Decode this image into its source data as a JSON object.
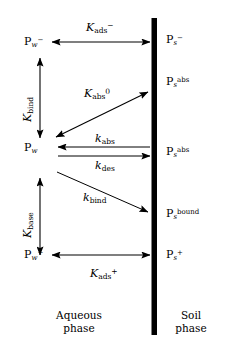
{
  "figure": {
    "soil_bar_color": "#000000",
    "background_color": "#ffffff",
    "stroke_color": "#000000"
  },
  "species": {
    "aqueous_anion": {
      "base": "P",
      "sub": "w",
      "sup": "−",
      "text": "P"
    },
    "aqueous_neutral": {
      "base": "P",
      "sub": "w",
      "sup": "",
      "text": "P"
    },
    "aqueous_cation": {
      "base": "P",
      "sub": "w",
      "sup": "+",
      "text": "P"
    },
    "soil_anion": {
      "base": "P",
      "sub": "s",
      "sup": "−",
      "text": "P"
    },
    "soil_abs_upper": {
      "base": "P",
      "sub": "s",
      "sup": "abs",
      "text": "P"
    },
    "soil_abs_lower": {
      "base": "P",
      "sub": "s",
      "sup": "abs",
      "text": "P"
    },
    "soil_bound": {
      "base": "P",
      "sub": "s",
      "sup": "bound",
      "text": "P"
    },
    "soil_cation": {
      "base": "P",
      "sub": "s",
      "sup": "+",
      "text": "P"
    }
  },
  "constants": {
    "k_ads_minus": {
      "base": "K",
      "sub": "ads",
      "sup": "−"
    },
    "k_abs_zero": {
      "base": "K",
      "sub": "abs",
      "sup": "0"
    },
    "k_abs": {
      "base": "k",
      "sub": "abs",
      "sup": ""
    },
    "k_des": {
      "base": "k",
      "sub": "des",
      "sup": ""
    },
    "k_bind": {
      "base": "k",
      "sub": "bind",
      "sup": ""
    },
    "k_ads_plus": {
      "base": "K",
      "sub": "ads",
      "sup": "+"
    },
    "K_bind": {
      "base": "K",
      "sub": "bind",
      "sup": ""
    },
    "K_base": {
      "base": "K",
      "sub": "base",
      "sup": ""
    }
  },
  "phases": {
    "aqueous_line1": "Aqueous",
    "aqueous_line2": "phase",
    "soil_line1": "Soil",
    "soil_line2": "phase"
  },
  "arrows": [
    {
      "name": "adsorption-anion-arrow",
      "type": "double-horizontal",
      "label": "k_ads_minus"
    },
    {
      "name": "acid-equilibrium-arrow",
      "type": "double-vertical",
      "label": "K_bind"
    },
    {
      "name": "absorption-equilibrium-arrow",
      "type": "double-diagonal",
      "label": "k_abs_zero"
    },
    {
      "name": "absorption-rate-arrow",
      "type": "single-left",
      "label": "k_abs"
    },
    {
      "name": "desorption-rate-arrow",
      "type": "single-right",
      "label": "k_des"
    },
    {
      "name": "binding-rate-arrow",
      "type": "single-diagonal-down",
      "label": "k_bind"
    },
    {
      "name": "base-equilibrium-arrow",
      "type": "double-vertical",
      "label": "K_base"
    },
    {
      "name": "adsorption-cation-arrow",
      "type": "double-horizontal",
      "label": "k_ads_plus"
    }
  ]
}
